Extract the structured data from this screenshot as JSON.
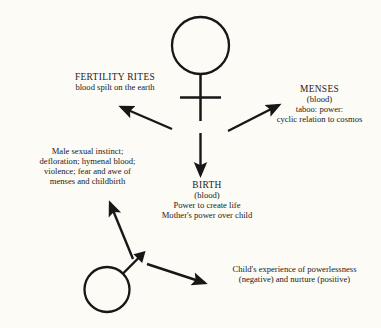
{
  "diagram": {
    "type": "concept-diagram",
    "background_color": "#fdfbf5",
    "ink_color": "#171717",
    "symbols": [
      {
        "name": "venus-symbol",
        "label": "female symbol",
        "position": "top-center"
      },
      {
        "name": "mars-symbol",
        "label": "male symbol",
        "position": "bottom-left"
      }
    ],
    "nodes": {
      "fertility_rites": {
        "title": "FERTILITY RITES",
        "lines": [
          "blood spilt on the earth"
        ]
      },
      "menses": {
        "title": "MENSES",
        "lines": [
          "(blood)",
          "taboo: power:",
          "cyclic relation to cosmos"
        ]
      },
      "male_instinct": {
        "lines": [
          "Male sexual instinct;",
          "defloration; hymenal blood;",
          "violence; fear and awe of",
          "menses and childbirth"
        ]
      },
      "birth": {
        "title": "BIRTH",
        "lines": [
          "(blood)",
          "Power to create life",
          "Mother's power over child"
        ]
      },
      "child_experience": {
        "lines": [
          "Child's experience of powerlessness",
          "(negative) and nurture (positive)"
        ]
      }
    },
    "arrows": [
      {
        "name": "arrow-to-fertility-rites",
        "from": "venus-symbol",
        "to": "fertility_rites",
        "direction": "up-left"
      },
      {
        "name": "arrow-to-menses",
        "from": "venus-symbol",
        "to": "menses",
        "direction": "up-right"
      },
      {
        "name": "arrow-to-birth",
        "from": "venus-symbol",
        "to": "birth",
        "direction": "down"
      },
      {
        "name": "arrow-to-male-instinct",
        "from": "mars-symbol",
        "to": "male_instinct",
        "direction": "up-left"
      },
      {
        "name": "arrow-to-child-experience",
        "from": "mars-symbol",
        "to": "child_experience",
        "direction": "down-right"
      }
    ]
  }
}
